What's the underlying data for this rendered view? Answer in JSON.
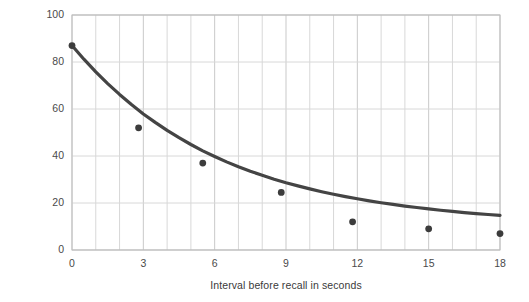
{
  "chart_data": {
    "type": "scatter",
    "title": "",
    "subtitle": "",
    "xlabel": "Interval before recall in seconds",
    "ylabel": "Percent of accuracy of recall",
    "xlim": [
      0,
      18
    ],
    "ylim": [
      0,
      100
    ],
    "xticks": [
      0,
      3,
      6,
      9,
      12,
      15,
      18
    ],
    "xtick_labels": [
      "0",
      "3",
      "6",
      "9",
      "12",
      "15",
      "18"
    ],
    "yticks": [
      0,
      20,
      40,
      60,
      80,
      100
    ],
    "ytick_labels": [
      "0",
      "20",
      "40",
      "60",
      "80",
      "100"
    ],
    "x_minor_gridlines": [
      1,
      2,
      4,
      5,
      7,
      8,
      10,
      11,
      13,
      14,
      16,
      17
    ],
    "grid": true,
    "legend": null,
    "legend_position": "none",
    "points": [
      {
        "x": 0.0,
        "y": 87
      },
      {
        "x": 2.8,
        "y": 52
      },
      {
        "x": 5.5,
        "y": 37
      },
      {
        "x": 8.8,
        "y": 24.5
      },
      {
        "x": 11.8,
        "y": 12
      },
      {
        "x": 15.0,
        "y": 9
      },
      {
        "x": 18.0,
        "y": 7
      }
    ],
    "fit_curve": {
      "name": "exponential decay fit",
      "x": [
        0,
        0.5,
        1,
        1.5,
        2,
        2.5,
        3,
        3.5,
        4,
        4.5,
        5,
        5.5,
        6,
        6.5,
        7,
        7.5,
        8,
        8.5,
        9,
        9.5,
        10,
        10.5,
        11,
        11.5,
        12,
        12.5,
        13,
        13.5,
        14,
        14.5,
        15,
        15.5,
        16,
        16.5,
        17,
        17.5,
        18
      ],
      "y": [
        87.0,
        81.2,
        75.8,
        70.8,
        66.2,
        61.9,
        57.9,
        54.3,
        50.9,
        47.8,
        44.9,
        42.2,
        39.8,
        37.5,
        35.4,
        33.5,
        31.8,
        30.1,
        28.6,
        27.3,
        26.0,
        24.8,
        23.7,
        22.7,
        21.8,
        20.9,
        20.1,
        19.4,
        18.7,
        18.1,
        17.5,
        16.9,
        16.4,
        15.9,
        15.5,
        15.1,
        14.7
      ]
    },
    "colors": {
      "curve": "#444444",
      "point": "#3c3c3c",
      "grid": "#d8d8d8",
      "axis": "#bfbfbf",
      "text": "#3a3a3a",
      "background": "#ffffff"
    }
  }
}
